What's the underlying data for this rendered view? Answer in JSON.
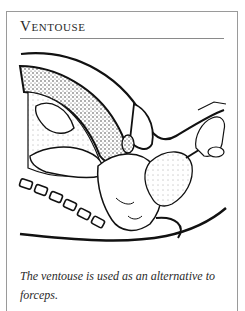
{
  "sidebar": {
    "title": "Ventouse",
    "figure": {
      "subject": "ventouse-delivery-illustration",
      "ink_color": "#111111",
      "background": "#ffffff"
    },
    "caption": "The ventouse is used as an alternative to forceps."
  },
  "colors": {
    "border": "#9a9a9a",
    "rule": "#8a8a8a",
    "text": "#2a2a2a"
  }
}
